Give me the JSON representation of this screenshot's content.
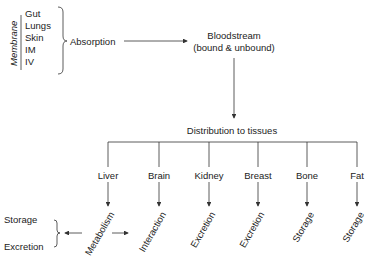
{
  "diagram": {
    "membrane_label": "Membrane",
    "routes": [
      "Gut",
      "Lungs",
      "Skin",
      "IM",
      "IV"
    ],
    "absorption": "Absorption",
    "bloodstream": {
      "line1": "Bloodstream",
      "line2": "(bound & unbound)"
    },
    "distribution": "Distribution to tissues",
    "tissues": [
      {
        "name": "Liver",
        "outcome": "Metabolism"
      },
      {
        "name": "Brain",
        "outcome": "Interaction"
      },
      {
        "name": "Kidney",
        "outcome": "Excretion"
      },
      {
        "name": "Breast",
        "outcome": "Excretion"
      },
      {
        "name": "Bone",
        "outcome": "Storage"
      },
      {
        "name": "Fat",
        "outcome": "Storage"
      }
    ],
    "metabolism_outputs": [
      "Storage",
      "Excretion"
    ],
    "line_color": "#333333"
  }
}
